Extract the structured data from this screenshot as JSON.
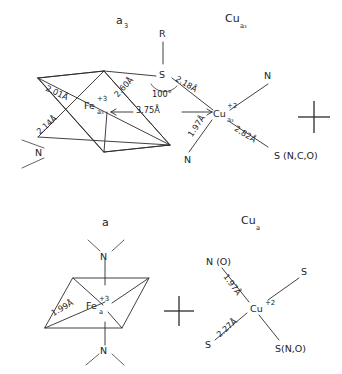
{
  "figure": {
    "kind": "chemical-structure-diagram",
    "background_color": "#ffffff",
    "line_color": "#2b2b2b",
    "text_color": "#1d1d1d"
  },
  "panels": {
    "top_left": {
      "title": "a",
      "title_sub": "3",
      "center_atom": "Fe",
      "center_sub": "a₃",
      "center_charge": "+3",
      "ligand_n_label": "N",
      "bond_2_01": "2.01Å",
      "bond_2_14": "2.14Å",
      "bond_2_60": "2.60Å"
    },
    "bridge": {
      "bridge_atom": "S",
      "r_group": "R",
      "angle": "100°",
      "bond_2_18": "2.18Å",
      "metal_metal_distance": "3.75Å"
    },
    "top_right": {
      "title": "Cu",
      "title_sub": "a₃",
      "center_atom": "Cu",
      "center_sub": "a₃",
      "center_charge": "+2",
      "ligand_n_upper": "N",
      "ligand_n_lower": "N",
      "bond_1_97": "1.97Å",
      "bond_2_82": "2.82Å",
      "ligand_s_mixed": "S (N,C,O)"
    },
    "bottom_left": {
      "title": "a",
      "center_atom": "Fe",
      "center_sub": "a",
      "center_charge": "+3",
      "bond_1_99": "1.99Å",
      "ligand_n_top": "N",
      "ligand_n_bottom": "N"
    },
    "bottom_right": {
      "title": "Cu",
      "title_sub": "a",
      "center_atom": "Cu",
      "center_charge": "+2",
      "ligand_no": "N (O)",
      "ligand_s_upper_right": "S",
      "ligand_s_lower_left": "S",
      "ligand_s_mixed": "S(N,O)",
      "bond_1_97": "1.97Å",
      "bond_2_27": "2.27Å"
    }
  },
  "separators": {
    "top_plus": "+",
    "bottom_plus": "+"
  }
}
